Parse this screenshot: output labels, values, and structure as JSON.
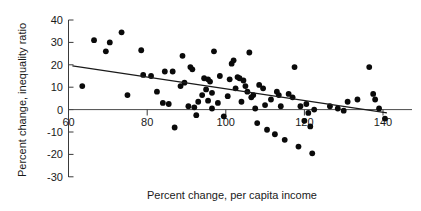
{
  "chart_data": {
    "type": "scatter",
    "title": "",
    "xlabel": "Percent change, per capita income",
    "ylabel": "Percent change, inequality ratio",
    "xlim": [
      58,
      143
    ],
    "ylim": [
      -30,
      40
    ],
    "xticks": [
      60,
      80,
      100,
      120,
      140
    ],
    "xtick_labels": [
      "60",
      "80",
      "100",
      "120",
      "140"
    ],
    "yticks": [
      -30,
      -20,
      -10,
      0,
      10,
      20,
      30,
      40
    ],
    "ytick_labels": [
      "-30",
      "-20",
      "-10",
      "0",
      "10",
      "20",
      "30",
      "40"
    ],
    "grid": false,
    "legend": null,
    "marker": "filled-circle",
    "marker_color": "#0a0a0a",
    "marker_size": 5,
    "trendline": {
      "type": "linear",
      "x_start": 61,
      "y_start": 19.5,
      "x_end": 141,
      "y_end": -1.5,
      "color": "#1a1a1a"
    },
    "points": [
      [
        63.5,
        10.5
      ],
      [
        66.5,
        31.0
      ],
      [
        69.5,
        26.0
      ],
      [
        70.5,
        30.0
      ],
      [
        73.5,
        34.5
      ],
      [
        75.0,
        6.5
      ],
      [
        78.5,
        26.5
      ],
      [
        79.0,
        15.5
      ],
      [
        81.0,
        15.0
      ],
      [
        82.5,
        8.0
      ],
      [
        84.0,
        3.0
      ],
      [
        84.5,
        17.0
      ],
      [
        85.5,
        2.5
      ],
      [
        86.5,
        17.0
      ],
      [
        87.0,
        -8.0
      ],
      [
        88.5,
        10.5
      ],
      [
        89.0,
        24.0
      ],
      [
        89.5,
        12.0
      ],
      [
        90.5,
        1.5
      ],
      [
        91.0,
        19.0
      ],
      [
        91.5,
        18.0
      ],
      [
        92.0,
        1.0
      ],
      [
        92.5,
        -2.5
      ],
      [
        93.0,
        3.5
      ],
      [
        94.0,
        6.5
      ],
      [
        94.5,
        14.0
      ],
      [
        95.0,
        9.0
      ],
      [
        95.5,
        13.5
      ],
      [
        95.5,
        4.0
      ],
      [
        96.0,
        12.5
      ],
      [
        96.5,
        0.5
      ],
      [
        96.5,
        7.5
      ],
      [
        97.0,
        26.0
      ],
      [
        98.0,
        3.0
      ],
      [
        98.5,
        15.0
      ],
      [
        99.5,
        -3.0
      ],
      [
        100.5,
        6.0
      ],
      [
        101.0,
        13.5
      ],
      [
        101.5,
        20.5
      ],
      [
        102.0,
        22.0
      ],
      [
        102.5,
        9.5
      ],
      [
        103.0,
        14.5
      ],
      [
        103.5,
        14.0
      ],
      [
        104.0,
        3.5
      ],
      [
        104.5,
        13.0
      ],
      [
        105.0,
        10.5
      ],
      [
        105.5,
        8.0
      ],
      [
        106.0,
        25.5
      ],
      [
        106.5,
        5.5
      ],
      [
        107.0,
        6.5
      ],
      [
        107.5,
        0.5
      ],
      [
        108.0,
        -6.0
      ],
      [
        108.5,
        11.0
      ],
      [
        109.5,
        9.5
      ],
      [
        110.0,
        2.0
      ],
      [
        110.5,
        -9.0
      ],
      [
        111.5,
        4.5
      ],
      [
        112.5,
        -11.0
      ],
      [
        113.0,
        8.0
      ],
      [
        113.5,
        6.5
      ],
      [
        114.0,
        1.5
      ],
      [
        115.0,
        -13.5
      ],
      [
        116.0,
        7.0
      ],
      [
        117.0,
        5.5
      ],
      [
        117.5,
        19.0
      ],
      [
        118.5,
        -16.5
      ],
      [
        119.0,
        1.5
      ],
      [
        120.0,
        -5.0
      ],
      [
        120.5,
        2.5
      ],
      [
        121.0,
        -1.5
      ],
      [
        121.5,
        -7.5
      ],
      [
        122.0,
        -19.5
      ],
      [
        122.5,
        0.0
      ],
      [
        126.5,
        1.5
      ],
      [
        128.5,
        0.5
      ],
      [
        130.0,
        -0.5
      ],
      [
        131.0,
        3.5
      ],
      [
        133.5,
        4.5
      ],
      [
        136.5,
        19.0
      ],
      [
        137.5,
        7.0
      ],
      [
        138.0,
        4.5
      ],
      [
        139.0,
        0.5
      ],
      [
        140.5,
        -4.0
      ]
    ]
  },
  "axes": {
    "x_axis_title": "Percent change, per capita income",
    "y_axis_title": "Percent change, inequality ratio"
  }
}
